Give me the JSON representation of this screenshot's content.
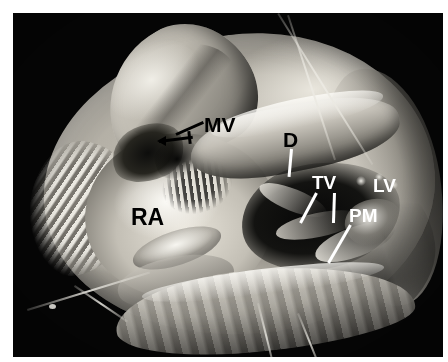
{
  "figure": {
    "domain": "natural-image",
    "view": "Opened four-chamber dissection, right atrium and ventricular cavity exposed",
    "background_color": "#050505",
    "mount_color": "#ffffff",
    "palette": {
      "tissue_light": "#eceae2",
      "tissue_mid": "#b4b0a6",
      "tissue_dark": "#3a3935",
      "cavity_black": "#0a0a09",
      "label_dark": "#000000",
      "label_light": "#ffffff",
      "suture_white": "#ecebe4"
    }
  },
  "annotations": [
    {
      "id": "mv",
      "text": "MV",
      "meaning": "mitral valve",
      "color": "#000000",
      "leader": "line-left-down",
      "has_arrow": true
    },
    {
      "id": "d",
      "text": "D",
      "meaning": "defect",
      "color": "#000000",
      "leader": "line-down",
      "has_arrow": false
    },
    {
      "id": "tv",
      "text": "TV",
      "meaning": "tricuspid valve",
      "color": "#ffffff",
      "leader": "two-lines-down",
      "has_arrow": false
    },
    {
      "id": "lv",
      "text": "LV",
      "meaning": "left ventricle",
      "color": "#ffffff",
      "leader": "none",
      "has_arrow": false
    },
    {
      "id": "pm",
      "text": "PM",
      "meaning": "papillary muscle",
      "color": "#ffffff",
      "leader": "line-down-right",
      "has_arrow": false
    },
    {
      "id": "ra",
      "text": "RA",
      "meaning": "right atrium",
      "color": "#000000",
      "leader": "none",
      "has_arrow": false
    }
  ],
  "labels": {
    "mv": "MV",
    "d": "D",
    "tv": "TV",
    "lv": "LV",
    "pm": "PM",
    "ra": "RA"
  },
  "structures": [
    {
      "name": "reflected-atrial-flap",
      "region": "upper-left"
    },
    {
      "name": "right-atrium-endocardium",
      "region": "center-left"
    },
    {
      "name": "pectinate-muscles",
      "region": "center"
    },
    {
      "name": "septal-band",
      "region": "center-right"
    },
    {
      "name": "ventricular-cavity",
      "region": "right-of-center"
    },
    {
      "name": "papillary-muscle",
      "region": "right"
    },
    {
      "name": "myocardial-free-wall",
      "region": "bottom"
    },
    {
      "name": "suture-thread-upper-right",
      "region": "upper-right"
    },
    {
      "name": "suture-thread-lower-left",
      "region": "lower-left"
    }
  ]
}
